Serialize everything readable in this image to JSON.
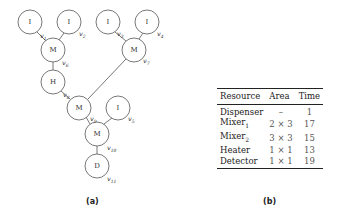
{
  "diagram": {
    "caption": "(a)",
    "nodes": [
      {
        "id": "v1",
        "label": "I",
        "x": 30,
        "y": 22
      },
      {
        "id": "v2",
        "label": "I",
        "x": 69,
        "y": 22
      },
      {
        "id": "v3",
        "label": "I",
        "x": 108,
        "y": 22
      },
      {
        "id": "v4",
        "label": "I",
        "x": 147,
        "y": 22
      },
      {
        "id": "v6",
        "label": "M",
        "x": 53,
        "y": 50
      },
      {
        "id": "v7",
        "label": "M",
        "x": 134,
        "y": 50
      },
      {
        "id": "h",
        "label": "H",
        "x": 53,
        "y": 82
      },
      {
        "id": "v9",
        "label": "M",
        "x": 79,
        "y": 108
      },
      {
        "id": "v5",
        "label": "I",
        "x": 118,
        "y": 108
      },
      {
        "id": "v10",
        "label": "M",
        "x": 97,
        "y": 134
      },
      {
        "id": "v11",
        "label": "D",
        "x": 97,
        "y": 166
      }
    ],
    "edge_labels": [
      {
        "text": "v",
        "sub": "1",
        "x": 40,
        "y": 38
      },
      {
        "text": "v",
        "sub": "2",
        "x": 79,
        "y": 36
      },
      {
        "text": "v",
        "sub": "3",
        "x": 117,
        "y": 36
      },
      {
        "text": "v",
        "sub": "4",
        "x": 157,
        "y": 36
      },
      {
        "text": "v",
        "sub": "6",
        "x": 62,
        "y": 65
      },
      {
        "text": "v",
        "sub": "7",
        "x": 143,
        "y": 63
      },
      {
        "text": "v",
        "sub": "8",
        "x": 63,
        "y": 97
      },
      {
        "text": "v",
        "sub": "9",
        "x": 90,
        "y": 121
      },
      {
        "text": "v",
        "sub": "5",
        "x": 128,
        "y": 121
      },
      {
        "text": "v",
        "sub": "10",
        "x": 107,
        "y": 150
      },
      {
        "text": "v",
        "sub": "11",
        "x": 107,
        "y": 181
      }
    ]
  },
  "table": {
    "caption": "(b)",
    "headers": [
      "Resource",
      "Area",
      "Time"
    ],
    "rows": [
      {
        "name": "Dispenser",
        "sub": "",
        "area": "–",
        "time": "1"
      },
      {
        "name": "Mixer",
        "sub": "1",
        "area": "2 × 3",
        "time": "17"
      },
      {
        "name": "Mixer",
        "sub": "2",
        "area": "3 × 3",
        "time": "15"
      },
      {
        "name": "Heater",
        "sub": "",
        "area": "1 × 1",
        "time": "13"
      },
      {
        "name": "Detector",
        "sub": "",
        "area": "1 × 1",
        "time": "19"
      }
    ]
  }
}
